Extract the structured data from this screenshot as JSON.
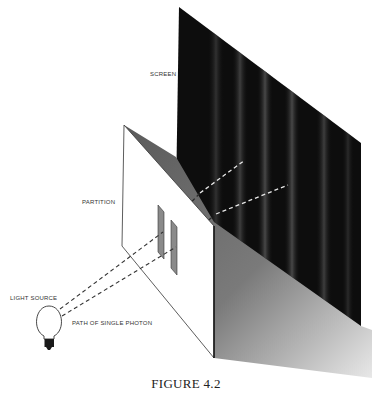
{
  "figure": {
    "caption": "FIGURE 4.2",
    "labels": {
      "screen": "SCREEN",
      "partition": "PARTITION",
      "light_source": "LIGHT SOURCE",
      "photon_path": "PATH OF SINGLE PHOTON"
    },
    "components": [
      "light-source",
      "partition-with-two-slits",
      "screen-with-interference-bands"
    ],
    "colors": {
      "screen": "#0d0d0d",
      "band": "#4a4a4a",
      "partition": "#ffffff",
      "shadow": "#6e6e6e",
      "slit": "#8a8a8a",
      "line": "#333333"
    }
  }
}
